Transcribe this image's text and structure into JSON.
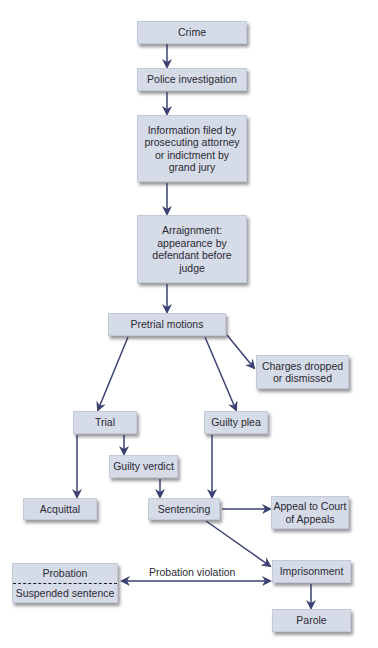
{
  "colors": {
    "box_fill": "#d6dbe8",
    "arrow": "#3b4173",
    "text": "#2a2a33"
  },
  "nodes": {
    "crime": "Crime",
    "police": "Police investigation",
    "information": [
      "Information filed by",
      "prosecuting attorney",
      "or indictment by",
      "grand jury"
    ],
    "arraignment": [
      "Arraignment:",
      "appearance by",
      "defendant before",
      "judge"
    ],
    "pretrial": "Pretrial motions",
    "charges": [
      "Charges dropped",
      "or dismissed"
    ],
    "trial": "Trial",
    "guilty_plea": "Guilty plea",
    "guilty_verdict": "Guilty verdict",
    "acquittal": "Acquittal",
    "sentencing": "Sentencing",
    "appeal": [
      "Appeal to Court",
      "of Appeals"
    ],
    "imprisonment": "Imprisonment",
    "probation": "Probation",
    "suspended": "Suspended sentence",
    "parole": "Parole"
  },
  "edge_labels": {
    "probation_violation": "Probation violation"
  }
}
